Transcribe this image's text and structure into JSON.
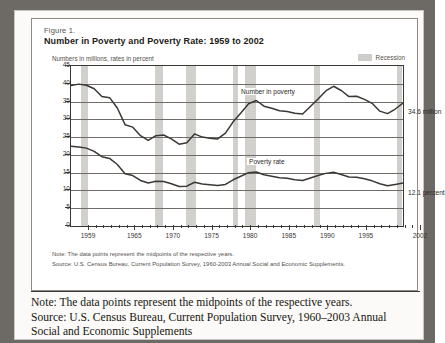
{
  "figure": {
    "number": "Figure 1.",
    "title": "Number in Poverty and Poverty Rate:  1959 to 2002",
    "axis_note": "Numbers in millions, rates in percent",
    "legend": {
      "swatch_name": "recession-swatch",
      "label": "Recession",
      "color": "#d2d0cd"
    },
    "note": "Note:  The data points represent the midpoints of the respective years.",
    "source": "Source:  U.S. Census Bureau, Current Population Survey, 1960-2003 Annual Social and Economic Supplements."
  },
  "caption": {
    "line1": "Note: The data points represent the midpoints of the respective years.",
    "line2": "Source: U.S. Census Bureau, Current Population Survey, 1960–2003 Annual",
    "line3": "Social and Economic Supplements"
  },
  "chart_data": {
    "type": "line",
    "title": "Number in Poverty and Poverty Rate: 1959 to 2002",
    "subtitle": "Numbers in millions, rates in percent",
    "xlabel": "",
    "ylabel": "Numbers in millions, rates in percent",
    "xlim": [
      1959,
      2002
    ],
    "ylim": [
      0,
      45
    ],
    "yticks": [
      0,
      5,
      10,
      15,
      20,
      25,
      30,
      35,
      40,
      45
    ],
    "xticks_major": [
      1959,
      1965,
      1970,
      1975,
      1980,
      1985,
      1990,
      1995,
      2002
    ],
    "grid": "horizontal",
    "legend_position": "top-right",
    "line_color": "#3a3835",
    "x": [
      1959,
      1960,
      1961,
      1962,
      1963,
      1964,
      1965,
      1966,
      1967,
      1968,
      1969,
      1970,
      1971,
      1972,
      1973,
      1974,
      1975,
      1976,
      1977,
      1978,
      1979,
      1980,
      1981,
      1982,
      1983,
      1984,
      1985,
      1986,
      1987,
      1988,
      1989,
      1990,
      1991,
      1992,
      1993,
      1994,
      1995,
      1996,
      1997,
      1998,
      1999,
      2000,
      2001,
      2002
    ],
    "series": [
      {
        "name": "Number in poverty",
        "units": "millions",
        "end_label": "34.6 million",
        "values": [
          39.5,
          39.9,
          39.6,
          38.6,
          36.4,
          36.1,
          33.2,
          28.5,
          27.8,
          25.4,
          24.1,
          25.4,
          25.6,
          24.5,
          23.0,
          23.4,
          25.9,
          25.0,
          24.7,
          24.5,
          26.1,
          29.3,
          31.8,
          34.4,
          35.3,
          33.7,
          33.1,
          32.4,
          32.2,
          31.7,
          31.5,
          33.6,
          35.7,
          38.0,
          39.3,
          38.1,
          36.4,
          36.5,
          35.6,
          34.5,
          32.3,
          31.6,
          32.9,
          34.6
        ]
      },
      {
        "name": "Poverty rate",
        "units": "percent",
        "end_label": "12.1 percent",
        "values": [
          22.4,
          22.2,
          21.9,
          21.0,
          19.5,
          19.0,
          17.3,
          14.7,
          14.2,
          12.8,
          12.1,
          12.6,
          12.5,
          11.9,
          11.1,
          11.2,
          12.3,
          11.8,
          11.6,
          11.4,
          11.7,
          13.0,
          14.0,
          15.0,
          15.2,
          14.4,
          14.0,
          13.6,
          13.4,
          13.0,
          12.8,
          13.5,
          14.2,
          14.8,
          15.1,
          14.5,
          13.8,
          13.7,
          13.3,
          12.7,
          11.9,
          11.3,
          11.7,
          12.1
        ]
      }
    ],
    "annotations": [
      {
        "name": "number-in-poverty-label",
        "text": "Number in poverty"
      },
      {
        "name": "poverty-rate-label",
        "text": "Poverty rate"
      },
      {
        "name": "number-in-poverty-end-value",
        "text": "34.6 million"
      },
      {
        "name": "poverty-rate-end-value",
        "text": "12.1 percent"
      }
    ],
    "recessions": [
      {
        "start": 1960.3,
        "end": 1961.2
      },
      {
        "start": 1969.9,
        "end": 1970.9
      },
      {
        "start": 1973.9,
        "end": 1975.2
      },
      {
        "start": 1980.0,
        "end": 1980.6
      },
      {
        "start": 1981.5,
        "end": 1982.9
      },
      {
        "start": 1990.5,
        "end": 1991.2
      },
      {
        "start": 2001.2,
        "end": 2001.9
      }
    ]
  }
}
